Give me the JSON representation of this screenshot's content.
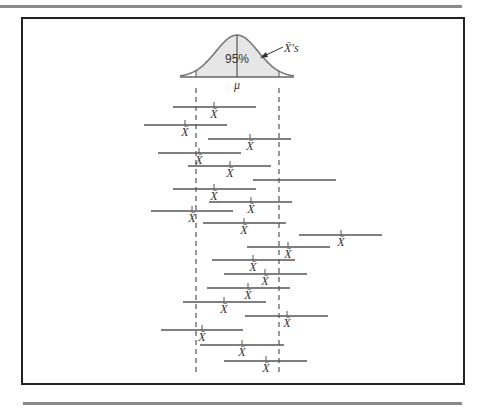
{
  "distribution": {
    "center_label": "μ",
    "area_label": "95%",
    "callout_label": "X̄'s",
    "fill_color": "#e6e6e6",
    "curve_color": "#777777",
    "center_x": 237,
    "left_bound_x": 196,
    "right_bound_x": 279,
    "baseline_y": 77,
    "peak_y": 35
  },
  "interval_label": "X̄",
  "intervals": [
    {
      "x1": 173,
      "x2": 256,
      "y": 107,
      "mean_x": 214,
      "label": "X̄"
    },
    {
      "x1": 144,
      "x2": 227,
      "y": 125,
      "mean_x": 185,
      "label": "X̄"
    },
    {
      "x1": 208,
      "x2": 291,
      "y": 139,
      "mean_x": 250,
      "label": "X̄"
    },
    {
      "x1": 158,
      "x2": 241,
      "y": 153,
      "mean_x": 199,
      "label": "X̄"
    },
    {
      "x1": 188,
      "x2": 271,
      "y": 166,
      "mean_x": 230,
      "label": "X̄"
    },
    {
      "x1": 253,
      "x2": 336,
      "y": 180,
      "mean_x": null,
      "label": ""
    },
    {
      "x1": 173,
      "x2": 256,
      "y": 189,
      "mean_x": 214,
      "label": "X̄"
    },
    {
      "x1": 209,
      "x2": 292,
      "y": 202,
      "mean_x": 251,
      "label": "X̄"
    },
    {
      "x1": 151,
      "x2": 233,
      "y": 211,
      "mean_x": 192,
      "label": "X̄"
    },
    {
      "x1": 203,
      "x2": 286,
      "y": 223,
      "mean_x": 244,
      "label": "X̄"
    },
    {
      "x1": 299,
      "x2": 382,
      "y": 235,
      "mean_x": 341,
      "label": "X̄"
    },
    {
      "x1": 247,
      "x2": 330,
      "y": 247,
      "mean_x": 288,
      "label": "X̄"
    },
    {
      "x1": 212,
      "x2": 295,
      "y": 260,
      "mean_x": 253,
      "label": "X̄"
    },
    {
      "x1": 224,
      "x2": 307,
      "y": 274,
      "mean_x": 265,
      "label": "X̄"
    },
    {
      "x1": 207,
      "x2": 290,
      "y": 288,
      "mean_x": 248,
      "label": "X̄"
    },
    {
      "x1": 183,
      "x2": 266,
      "y": 302,
      "mean_x": 224,
      "label": "X̄"
    },
    {
      "x1": 245,
      "x2": 328,
      "y": 316,
      "mean_x": 287,
      "label": "X̄"
    },
    {
      "x1": 161,
      "x2": 243,
      "y": 330,
      "mean_x": 202,
      "label": "X̄"
    },
    {
      "x1": 200,
      "x2": 284,
      "y": 345,
      "mean_x": 242,
      "label": "X̄"
    },
    {
      "x1": 224,
      "x2": 307,
      "y": 361,
      "mean_x": 266,
      "label": "X̄"
    }
  ],
  "dashed_bounds": {
    "top_y": 88,
    "bottom_y": 373
  }
}
